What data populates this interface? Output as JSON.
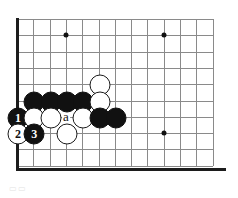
{
  "figure": {
    "kind": "go-board-diagram",
    "caption": "",
    "caption_artifact": "▭▭",
    "background_color": "#ffffff"
  },
  "board": {
    "grid_line_color": "#8a8a8a",
    "edge_color": "#1c1c1c",
    "origin_x": 17,
    "origin_y": 19,
    "spacing": 16.3,
    "cols": 13,
    "rows": 10,
    "edges": {
      "left": true,
      "bottom": true,
      "top": false,
      "right": false
    },
    "star_points": [
      {
        "col": 3,
        "row": 1
      },
      {
        "col": 9,
        "row": 1
      },
      {
        "col": 9,
        "row": 7
      }
    ]
  },
  "stones": [
    {
      "color": "black",
      "col": 1,
      "row": 5,
      "label": ""
    },
    {
      "color": "black",
      "col": 2,
      "row": 5,
      "label": ""
    },
    {
      "color": "black",
      "col": 3,
      "row": 5,
      "label": ""
    },
    {
      "color": "black",
      "col": 4,
      "row": 5,
      "label": ""
    },
    {
      "color": "white",
      "col": 5,
      "row": 4,
      "label": ""
    },
    {
      "color": "white",
      "col": 5,
      "row": 5,
      "label": ""
    },
    {
      "color": "black",
      "col": 0,
      "row": 6,
      "label": "1"
    },
    {
      "color": "white",
      "col": 1,
      "row": 6,
      "label": ""
    },
    {
      "color": "white",
      "col": 2,
      "row": 6,
      "label": ""
    },
    {
      "color": "white",
      "col": 4,
      "row": 6,
      "label": ""
    },
    {
      "color": "black",
      "col": 5,
      "row": 6,
      "label": ""
    },
    {
      "color": "black",
      "col": 6,
      "row": 6,
      "label": ""
    },
    {
      "color": "white",
      "col": 0,
      "row": 7,
      "label": "2"
    },
    {
      "color": "black",
      "col": 1,
      "row": 7,
      "label": "3"
    },
    {
      "color": "white",
      "col": 3,
      "row": 7,
      "label": ""
    }
  ],
  "point_labels": [
    {
      "text": "a",
      "col": 3,
      "row": 6
    }
  ],
  "colors": {
    "black_stone": "#111111",
    "white_stone": "#ffffff",
    "white_stone_outline": "#1a1a1a",
    "grid": "#8a8a8a",
    "border": "#1c1c1c"
  }
}
